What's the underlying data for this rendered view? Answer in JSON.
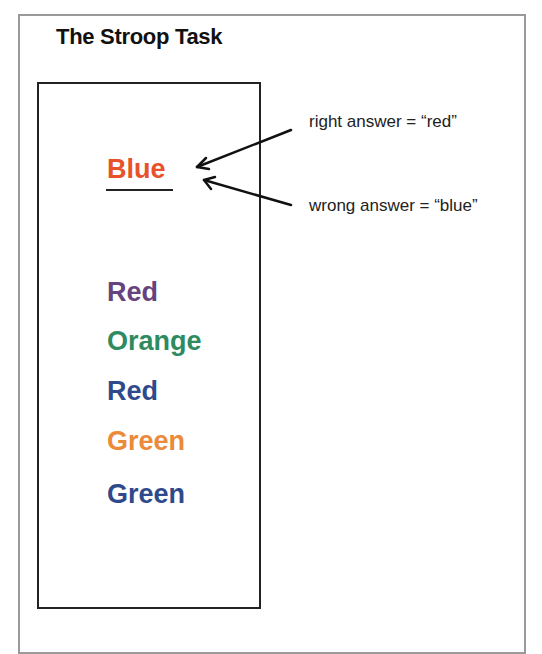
{
  "title": "The Stroop Task",
  "target": {
    "word": "Blue",
    "ink_color": "#e8512a",
    "underlined": true
  },
  "annotations": [
    {
      "text": "right answer = “red”"
    },
    {
      "text": "wrong answer = “blue”"
    }
  ],
  "word_list": [
    {
      "word": "Red",
      "ink_color": "#66427e"
    },
    {
      "word": "Orange",
      "ink_color": "#2e8b5f"
    },
    {
      "word": "Red",
      "ink_color": "#2f4a8c"
    },
    {
      "word": "Green",
      "ink_color": "#ea8a3a"
    },
    {
      "word": "Green",
      "ink_color": "#2f4a8c"
    }
  ]
}
